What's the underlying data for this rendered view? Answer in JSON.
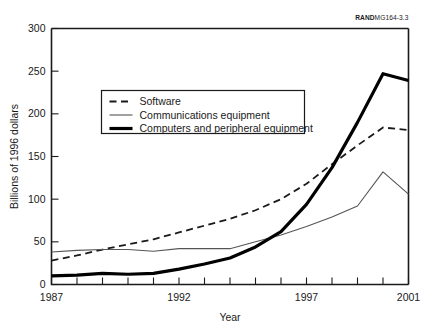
{
  "figure": {
    "source_tag_bold": "RAND",
    "source_tag_rest": "MG164-3.3"
  },
  "chart_data": {
    "type": "line",
    "title": "",
    "xlabel": "Year",
    "ylabel": "Billions of 1996 dollars",
    "xlim": [
      1987,
      2001
    ],
    "ylim": [
      0,
      300
    ],
    "xticks": [
      1987,
      1988,
      1989,
      1990,
      1991,
      1992,
      1993,
      1994,
      1995,
      1996,
      1997,
      1998,
      1999,
      2000,
      2001
    ],
    "xtick_labels_shown": [
      "1987",
      "1992",
      "1997",
      "2001"
    ],
    "xtick_labels_shown_values": [
      1987,
      1992,
      1997,
      2001
    ],
    "yticks": [
      0,
      50,
      100,
      150,
      200,
      250,
      300
    ],
    "ytick_labels": [
      "0",
      "50",
      "100",
      "150",
      "200",
      "250",
      "300"
    ],
    "grid": false,
    "legend_position": "upper-left-inside",
    "x": [
      1987,
      1988,
      1989,
      1990,
      1991,
      1992,
      1993,
      1994,
      1995,
      1996,
      1997,
      1998,
      1999,
      2000,
      2001
    ],
    "series": [
      {
        "name": "Software",
        "style": "dashed",
        "color": "#1a1a1a",
        "width": 1.8,
        "values": [
          28,
          34,
          41,
          47,
          53,
          61,
          69,
          77,
          87,
          100,
          118,
          141,
          163,
          184,
          181
        ]
      },
      {
        "name": "Communications equipment",
        "style": "thin-solid",
        "color": "#555555",
        "width": 1.1,
        "values": [
          38,
          40,
          41,
          41,
          39,
          42,
          42,
          42,
          50,
          58,
          68,
          79,
          92,
          132,
          106
        ]
      },
      {
        "name": "Computers and peripheral equipment",
        "style": "thick-solid",
        "color": "#000000",
        "width": 3.2,
        "values": [
          10,
          11,
          13,
          12,
          13,
          18,
          24,
          31,
          44,
          62,
          94,
          137,
          190,
          247,
          239
        ]
      }
    ]
  },
  "legend": {
    "items": [
      {
        "label": "Software"
      },
      {
        "label": "Communications equipment"
      },
      {
        "label": "Computers and peripheral equipment"
      }
    ]
  }
}
